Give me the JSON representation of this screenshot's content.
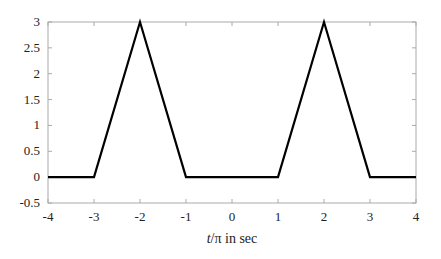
{
  "chart_data": {
    "type": "line",
    "title": "",
    "xlabel_italic": "t",
    "xlabel_rest": "/π in sec",
    "xlabel": "t/π in sec",
    "ylabel": "",
    "xlim": [
      -4,
      4
    ],
    "ylim": [
      -0.5,
      3
    ],
    "grid": false,
    "legend": null,
    "x_ticks": [
      -4,
      -3,
      -2,
      -1,
      0,
      1,
      2,
      3,
      4
    ],
    "x_tick_labels": [
      "-4",
      "-3",
      "-2",
      "-1",
      "0",
      "1",
      "2",
      "3",
      "4"
    ],
    "y_ticks": [
      -0.5,
      0,
      0.5,
      1,
      1.5,
      2,
      2.5,
      3
    ],
    "y_tick_labels": [
      "-0.5",
      "0",
      "0.5",
      "1",
      "1.5",
      "2",
      "2.5",
      "3"
    ],
    "series": [
      {
        "name": "signal",
        "color": "#000000",
        "x": [
          -4,
          -3,
          -2,
          -1,
          1,
          2,
          3,
          4
        ],
        "y": [
          0,
          0,
          3,
          0,
          0,
          3,
          0,
          0
        ]
      }
    ]
  },
  "colors": {
    "axis": "#aaaaaa",
    "line": "#000000",
    "text": "#222222"
  }
}
